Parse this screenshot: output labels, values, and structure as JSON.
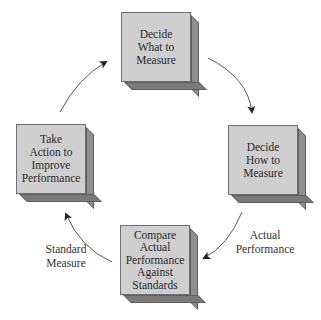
{
  "diagram": {
    "type": "cycle",
    "steps": [
      {
        "id": "decide-what",
        "text": "Decide What to Measure",
        "lines": [
          "Decide",
          "What to",
          "Measure"
        ]
      },
      {
        "id": "decide-how",
        "text": "Decide How to Measure",
        "lines": [
          "Decide",
          "How to",
          "Measure"
        ]
      },
      {
        "id": "compare",
        "text": "Compare Actual Performance Against Standards",
        "lines": [
          "Compare",
          "Actual",
          "Performance",
          "Against",
          "Standards"
        ]
      },
      {
        "id": "take-action",
        "text": "Take Action to Improve Performance",
        "lines": [
          "Take",
          "Action to",
          "Improve",
          "Performance"
        ]
      }
    ],
    "edge_labels": {
      "actual_performance": [
        "Actual",
        "Performance"
      ],
      "standard_measure": [
        "Standard",
        "Measure"
      ]
    },
    "colors": {
      "box_front": "#cfcfcf",
      "box_side": "#8f8f8f",
      "box_bottom": "#7a7a7a",
      "arrow": "#333333"
    }
  }
}
